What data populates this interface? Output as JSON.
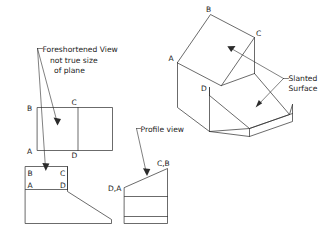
{
  "drawing": {
    "title": "Orthographic and isometric views of a wedge block with a slanted surface",
    "background_color": "#ffffff",
    "line_color": "#2b2b2b",
    "annotations": {
      "foreshortened": {
        "line1": "Foreshortened View",
        "line2": "not true size",
        "line3": "of plane"
      },
      "slanted_surface": {
        "line1": "Slanted",
        "line2": "Surface"
      },
      "profile_view": "Profile view"
    },
    "top_view": {
      "label_b": "B",
      "label_c": "C",
      "label_a": "A",
      "label_d": "D"
    },
    "front_view": {
      "label_b": "B",
      "label_c": "C",
      "label_a": "A",
      "label_d": "D"
    },
    "profile_view": {
      "label_da": "D,A",
      "label_cb": "C,B"
    },
    "isometric_view": {
      "label_a": "A",
      "label_b": "B",
      "label_c": "C",
      "label_d": "D"
    }
  }
}
